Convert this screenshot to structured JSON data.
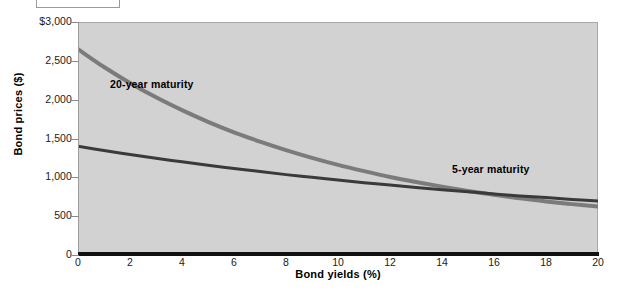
{
  "caption_box": {
    "text": ""
  },
  "chart_data": {
    "type": "line",
    "title": "",
    "xlabel": "Bond yields (%)",
    "ylabel": "Bond prices ($)",
    "xlim": [
      0,
      20
    ],
    "ylim": [
      0,
      3000
    ],
    "grid": false,
    "legend_position": "inline-annotations",
    "x_ticks": [
      0,
      2,
      4,
      6,
      8,
      10,
      12,
      14,
      16,
      18,
      20
    ],
    "x_tick_labels": [
      "0",
      "2",
      "4",
      "6",
      "8",
      "10",
      "12",
      "14",
      "16",
      "18",
      "20"
    ],
    "y_ticks": [
      0,
      500,
      1000,
      1500,
      2000,
      2500,
      3000
    ],
    "y_tick_labels": [
      "0",
      "500",
      "1,000",
      "1,500",
      "2,000",
      "2,500",
      "$3,000"
    ],
    "x": [
      0,
      1,
      2,
      3,
      4,
      5,
      6,
      7,
      8,
      9,
      10,
      11,
      12,
      13,
      14,
      15,
      16,
      17,
      18,
      19,
      20
    ],
    "series": [
      {
        "name": "20-year maturity",
        "color": "#7b7b7b",
        "label_x": 3.0,
        "label_y": 2210,
        "values": [
          2650,
          2420,
          2215,
          2030,
          1865,
          1715,
          1580,
          1460,
          1350,
          1250,
          1160,
          1080,
          1005,
          940,
          880,
          825,
          775,
          730,
          690,
          655,
          625
        ]
      },
      {
        "name": "5-year maturity",
        "color": "#3a3a3a",
        "label_x": 15.8,
        "label_y": 1115,
        "values": [
          1400,
          1345,
          1295,
          1245,
          1200,
          1155,
          1115,
          1075,
          1035,
          1000,
          965,
          930,
          900,
          870,
          840,
          815,
          785,
          760,
          740,
          715,
          695
        ]
      }
    ],
    "intersection": {
      "x": 8,
      "y": 1000
    },
    "plot_background": "#d2d2d2",
    "axis_color": "#111111"
  }
}
